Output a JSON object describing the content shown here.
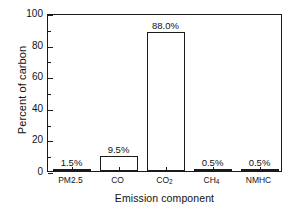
{
  "chart_data": {
    "type": "bar",
    "title": "",
    "xlabel": "Emission component",
    "ylabel": "Percent of carbon",
    "categories": [
      "PM2.5",
      "CO",
      "CO2",
      "CH4",
      "NMHC"
    ],
    "category_labels": [
      {
        "text": "PM2.5",
        "base": "PM2.5",
        "sub": ""
      },
      {
        "text": "CO",
        "base": "CO",
        "sub": ""
      },
      {
        "text": "CO2",
        "base": "CO",
        "sub": "2"
      },
      {
        "text": "CH4",
        "base": "CH",
        "sub": "4"
      },
      {
        "text": "NMHC",
        "base": "NMHC",
        "sub": ""
      }
    ],
    "values": [
      1.5,
      9.5,
      88.0,
      0.5,
      0.5
    ],
    "value_labels": [
      "1.5%",
      "9.5%",
      "88.0%",
      "0.5%",
      "0.5%"
    ],
    "ylim": [
      0,
      100
    ],
    "yticks": [
      0,
      20,
      40,
      60,
      80,
      100
    ],
    "ytick_labels": [
      "0",
      "20",
      "40",
      "60",
      "80",
      "100"
    ],
    "yminor_ticks": [
      10,
      30,
      50,
      70,
      90
    ],
    "grid": false,
    "legend": "none",
    "bar_fill_color": "#ffffff",
    "bar_edge_color": "#1a1a1a",
    "axis_color": "#1a1a1a",
    "background_color": "#ffffff",
    "text_color": "#111111"
  }
}
